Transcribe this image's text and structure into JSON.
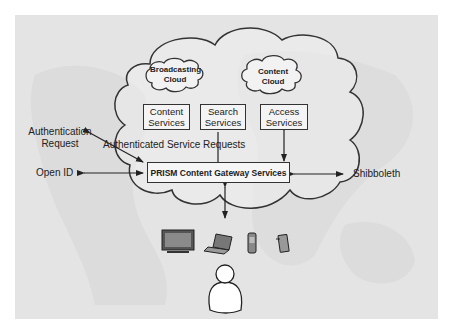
{
  "diagram": {
    "clouds": {
      "broadcasting": "Broadcasting\nCloud",
      "broadcasting_l1": "Broadcasting",
      "broadcasting_l2": "Cloud",
      "content_l1": "Content",
      "content_l2": "Cloud"
    },
    "services": [
      {
        "l1": "Content",
        "l2": "Services"
      },
      {
        "l1": "Search",
        "l2": "Services"
      },
      {
        "l1": "Access",
        "l2": "Services"
      }
    ],
    "gateway": "PRISM Content  Gateway Services",
    "labels": {
      "auth_request_l1": "Authentication",
      "auth_request_l2": "Request",
      "authenticated_requests": "Authenticated Service Requests",
      "open_id": "Open ID",
      "shibboleth": "Shibboleth"
    },
    "devices": [
      "tv-icon",
      "laptop-icon",
      "mobile-phone-icon",
      "pda-icon"
    ],
    "user": "user-icon",
    "colors": {
      "panel": "#e4e4e4",
      "stroke": "#333333",
      "text": "#222222"
    }
  }
}
